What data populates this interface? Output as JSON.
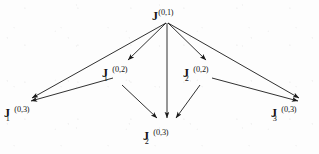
{
  "diagram": {
    "type": "directed-acyclic-graph",
    "stroke_color": "#1a1a1a",
    "text_color": "#131313",
    "background_color": "#fdfdfd",
    "nodes": [
      {
        "id": "J01",
        "base": "J",
        "superscript": "(0,1)",
        "subscript": "",
        "label": "J^(0,1)",
        "level": 1,
        "x": 167,
        "y": 14
      },
      {
        "id": "J1_02",
        "base": "J",
        "superscript": "(0,2)",
        "subscript": "1",
        "label": "J_1^(0,2)",
        "level": 2,
        "x": 118,
        "y": 72
      },
      {
        "id": "J2_02",
        "base": "J",
        "superscript": "(0,2)",
        "subscript": "2",
        "label": "J_2^(0,2)",
        "level": 2,
        "x": 199,
        "y": 72
      },
      {
        "id": "J1_03",
        "base": "J",
        "superscript": "(0,3)",
        "subscript": "1",
        "label": "J_1^(0,3)",
        "level": 3,
        "x": 18,
        "y": 112
      },
      {
        "id": "J2_03",
        "base": "J",
        "superscript": "(0,3)",
        "subscript": "2",
        "label": "J_2^(0,3)",
        "level": 3,
        "x": 158,
        "y": 135
      },
      {
        "id": "J3_03",
        "base": "J",
        "superscript": "(0,3)",
        "subscript": "3",
        "label": "J_3^(0,3)",
        "level": 3,
        "x": 286,
        "y": 112
      }
    ],
    "edges": [
      {
        "from": "J01",
        "to": "J1_03",
        "x1": 166,
        "y1": 23,
        "x2": 32,
        "y2": 98
      },
      {
        "from": "J01",
        "to": "J1_02",
        "x1": 166,
        "y1": 23,
        "x2": 128,
        "y2": 60
      },
      {
        "from": "J01",
        "to": "J2_03",
        "x1": 167,
        "y1": 23,
        "x2": 167,
        "y2": 118
      },
      {
        "from": "J01",
        "to": "J2_02",
        "x1": 168,
        "y1": 23,
        "x2": 206,
        "y2": 60
      },
      {
        "from": "J01",
        "to": "J3_03",
        "x1": 168,
        "y1": 23,
        "x2": 299,
        "y2": 98
      },
      {
        "from": "J1_02",
        "to": "J1_03",
        "x1": 113,
        "y1": 78,
        "x2": 31,
        "y2": 101
      },
      {
        "from": "J1_02",
        "to": "J2_03",
        "x1": 122,
        "y1": 85,
        "x2": 157,
        "y2": 118
      },
      {
        "from": "J2_02",
        "to": "J2_03",
        "x1": 200,
        "y1": 85,
        "x2": 176,
        "y2": 118
      },
      {
        "from": "J2_02",
        "to": "J3_03",
        "x1": 212,
        "y1": 78,
        "x2": 298,
        "y2": 101
      }
    ]
  }
}
